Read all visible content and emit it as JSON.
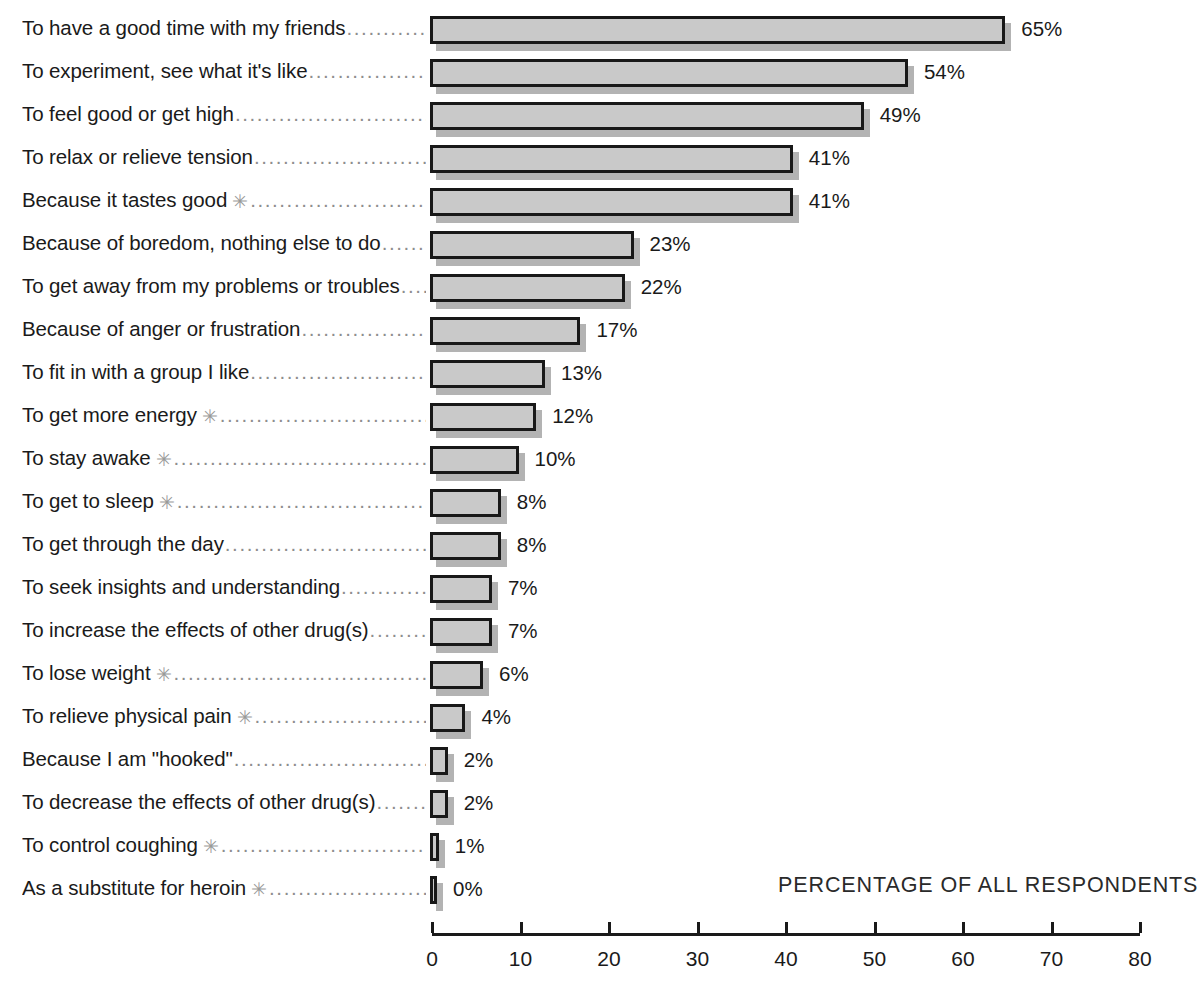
{
  "chart_data": {
    "type": "bar",
    "orientation": "horizontal",
    "title": "",
    "xlabel": "PERCENTAGE OF ALL RESPONDENTS",
    "ylabel": "",
    "xlim": [
      0,
      80
    ],
    "xticks": [
      0,
      10,
      20,
      30,
      40,
      50,
      60,
      70,
      80
    ],
    "grid": false,
    "legend": null,
    "value_suffix": "%",
    "footnote_marker": "✳",
    "categories": [
      "To have a good time with my friends",
      "To experiment, see what it's like",
      "To feel good or get high",
      "To relax or relieve tension",
      "Because it tastes good",
      "Because of boredom, nothing else to do",
      "To get away from my problems or troubles",
      "Because of anger or frustration",
      "To fit in with a group I like",
      "To get more energy",
      "To stay awake",
      "To get to sleep",
      "To get through the day",
      "To seek insights and understanding",
      "To increase the effects of other drug(s)",
      "To lose weight",
      "To relieve physical pain",
      "Because I am \"hooked\"",
      "To decrease the effects of other drug(s)",
      "To control coughing",
      "As a substitute for heroin"
    ],
    "values": [
      65,
      54,
      49,
      41,
      41,
      23,
      22,
      17,
      13,
      12,
      10,
      8,
      8,
      7,
      7,
      6,
      4,
      2,
      2,
      1,
      0
    ],
    "value_labels": [
      "65%",
      "54%",
      "49%",
      "41%",
      "41%",
      "23%",
      "22%",
      "17%",
      "13%",
      "12%",
      "10%",
      "8%",
      "8%",
      "7%",
      "7%",
      "6%",
      "4%",
      "2%",
      "2%",
      "1%",
      "0%"
    ],
    "starred": [
      false,
      false,
      false,
      false,
      true,
      false,
      false,
      false,
      false,
      true,
      true,
      true,
      false,
      false,
      false,
      true,
      true,
      false,
      false,
      true,
      true
    ],
    "colors": {
      "bar_fill": "#c9c9c9",
      "bar_border": "#181818",
      "bar_shadow": "#b3b3b3",
      "text": "#1a1a1a",
      "leader_dots": "#8d8d8d",
      "background": "#ffffff"
    }
  },
  "leader_dots": "................................................................................................."
}
